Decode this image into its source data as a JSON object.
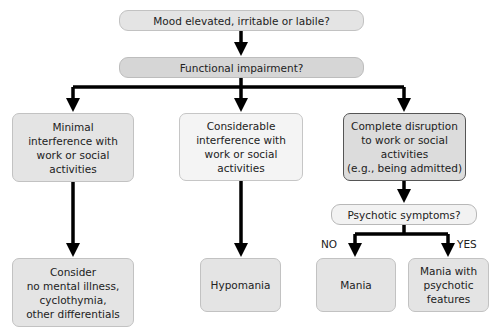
{
  "nodes": {
    "mood": "Mood elevated, irritable or labile?",
    "functional": "Functional impairment?",
    "minimal": "Minimal\ninterference with\nwork or social\nactivities",
    "considerable": "Considerable\ninterference with\nwork or social\nactivities",
    "complete": "Complete disruption\nto work or social\nactivities\n(e.g., being admitted)",
    "consider": "Consider\nno mental illness,\ncyclothymia,\nother differentials",
    "hypomania": "Hypomania",
    "psychotic_q": "Psychotic symptoms?",
    "mania": "Mania",
    "mania_psychotic": "Mania with\npsychotic\nfeatures"
  },
  "edge_labels": {
    "no": "NO",
    "yes": "YES"
  },
  "colors": {
    "arrow": "#000000",
    "box_fill": "#e0e0e0",
    "box_border": "#c0c0c0"
  }
}
